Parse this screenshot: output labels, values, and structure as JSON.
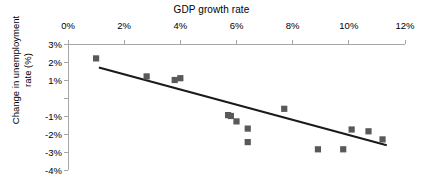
{
  "chart_data": {
    "type": "scatter",
    "title": "GDP growth rate",
    "xlabel": "GDP growth rate",
    "ylabel": "Change in unemployment\nrate (%)",
    "xlim": [
      0,
      12
    ],
    "ylim": [
      -4,
      3
    ],
    "xticks": [
      "0%",
      "2%",
      "4%",
      "6%",
      "8%",
      "10%",
      "12%"
    ],
    "xtick_values": [
      0,
      2,
      4,
      6,
      8,
      10,
      12
    ],
    "yticks": [
      "3%",
      "2%",
      "1%",
      "",
      "-1%",
      "-2%",
      "-3%",
      "-4%"
    ],
    "ytick_values": [
      3,
      2,
      1,
      0,
      -1,
      -2,
      -3,
      -4
    ],
    "grid": false,
    "legend": "none",
    "x_axis_position": "top",
    "marker_color": "#595959",
    "trendline_color": "#1a1a1a",
    "axis_color": "#a6a6a6",
    "series": [
      {
        "name": "Countries",
        "points": [
          {
            "x": 1.0,
            "y": 2.2
          },
          {
            "x": 2.8,
            "y": 1.2
          },
          {
            "x": 3.8,
            "y": 1.0
          },
          {
            "x": 4.0,
            "y": 1.1
          },
          {
            "x": 5.7,
            "y": -0.95
          },
          {
            "x": 5.8,
            "y": -1.0
          },
          {
            "x": 6.0,
            "y": -1.3
          },
          {
            "x": 6.4,
            "y": -1.7
          },
          {
            "x": 6.4,
            "y": -2.45
          },
          {
            "x": 7.7,
            "y": -0.6
          },
          {
            "x": 8.9,
            "y": -2.85
          },
          {
            "x": 9.8,
            "y": -2.85
          },
          {
            "x": 10.1,
            "y": -1.75
          },
          {
            "x": 10.7,
            "y": -1.85
          },
          {
            "x": 11.2,
            "y": -2.3
          }
        ]
      }
    ],
    "trendline": {
      "x1": 1.1,
      "y1": 1.7,
      "x2": 11.35,
      "y2": -2.62
    }
  }
}
